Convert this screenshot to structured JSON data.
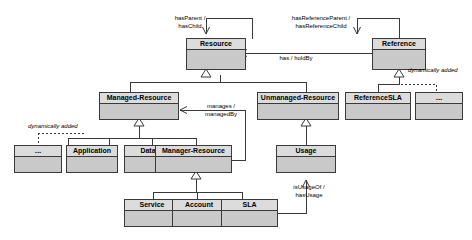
{
  "diagram": {
    "type": "uml-class-diagram",
    "colors": {
      "node_header_fill": "#dcdcdc",
      "node_body_fill": "#c9c9c9",
      "node_stroke": "#3a3a3a",
      "edge_stroke": "#3a3a3a",
      "background": "#ffffff",
      "text": "#000000"
    }
  },
  "nodes": [
    {
      "id": "resource",
      "label": "Resource"
    },
    {
      "id": "reference",
      "label": "Reference"
    },
    {
      "id": "managed_resource",
      "label": "Managed-Resource"
    },
    {
      "id": "unmanaged_resource",
      "label": "Unmanaged-Resource"
    },
    {
      "id": "reference_sla",
      "label": "ReferenceSLA"
    },
    {
      "id": "reference_ellipsis",
      "label": "..."
    },
    {
      "id": "managed_ellipsis",
      "label": "..."
    },
    {
      "id": "application",
      "label": "Application"
    },
    {
      "id": "data",
      "label": "Data"
    },
    {
      "id": "manager_resource",
      "label": "Manager-Resource"
    },
    {
      "id": "usage",
      "label": "Usage"
    },
    {
      "id": "service",
      "label": "Service"
    },
    {
      "id": "account",
      "label": "Account"
    },
    {
      "id": "sla",
      "label": "SLA"
    }
  ],
  "edge_labels": {
    "has_parent": {
      "line1": "hasParent /",
      "line2": "hasChild"
    },
    "has_reference_parent": {
      "line1": "hasReferenceParent /",
      "line2": "hasReferenceChild"
    },
    "has_holdby": {
      "line1": "has / holdBy"
    },
    "manages": {
      "line1": "manages /",
      "line2": "managedBy"
    },
    "is_usage_of": {
      "line1": "isUsageOf /",
      "line2": "hasUsage"
    },
    "dynamically_added_left": {
      "line1": "dynamically added"
    },
    "dynamically_added_right": {
      "line1": "dynamically added"
    }
  },
  "relationships": [
    {
      "from": "resource",
      "to": "resource",
      "kind": "association",
      "label": "hasParent / hasChild"
    },
    {
      "from": "reference",
      "to": "reference",
      "kind": "association",
      "label": "hasReferenceParent / hasReferenceChild"
    },
    {
      "from": "reference",
      "to": "resource",
      "kind": "association",
      "label": "has / holdBy"
    },
    {
      "from": "managed_resource",
      "to": "resource",
      "kind": "generalization",
      "label": ""
    },
    {
      "from": "unmanaged_resource",
      "to": "resource",
      "kind": "generalization",
      "label": ""
    },
    {
      "from": "reference_sla",
      "to": "reference",
      "kind": "generalization",
      "label": ""
    },
    {
      "from": "reference_ellipsis",
      "to": "reference",
      "kind": "generalization-dashed",
      "label": "dynamically added"
    },
    {
      "from": "managed_ellipsis",
      "to": "managed_resource",
      "kind": "generalization-dashed",
      "label": "dynamically added"
    },
    {
      "from": "application",
      "to": "managed_resource",
      "kind": "generalization",
      "label": ""
    },
    {
      "from": "data",
      "to": "managed_resource",
      "kind": "generalization",
      "label": ""
    },
    {
      "from": "manager_resource",
      "to": "managed_resource",
      "kind": "generalization",
      "label": ""
    },
    {
      "from": "manager_resource",
      "to": "managed_resource",
      "kind": "association",
      "label": "manages / managedBy"
    },
    {
      "from": "usage",
      "to": "unmanaged_resource",
      "kind": "generalization",
      "label": ""
    },
    {
      "from": "service",
      "to": "manager_resource",
      "kind": "generalization",
      "label": ""
    },
    {
      "from": "account",
      "to": "manager_resource",
      "kind": "generalization",
      "label": ""
    },
    {
      "from": "sla",
      "to": "manager_resource",
      "kind": "generalization",
      "label": ""
    },
    {
      "from": "sla",
      "to": "usage",
      "kind": "association",
      "label": "isUsageOf / hasUsage"
    }
  ]
}
